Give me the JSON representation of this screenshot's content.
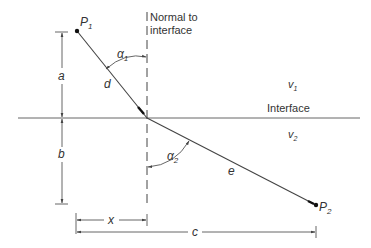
{
  "diagram": {
    "colors": {
      "background": "#ffffff",
      "line": "#555555",
      "ray": "#444444",
      "text": "#333333",
      "point": "#111111"
    },
    "points": {
      "p1": {
        "label": "P",
        "sub": "1"
      },
      "p2": {
        "label": "P",
        "sub": "2"
      }
    },
    "normal_label": {
      "line1": "Normal to",
      "line2": "interface"
    },
    "interface_label": "Interface",
    "media": {
      "upper": {
        "label": "v",
        "sub": "1"
      },
      "lower": {
        "label": "v",
        "sub": "2"
      }
    },
    "angles": {
      "incident": {
        "label": "α",
        "sub": "1"
      },
      "refracted": {
        "label": "α",
        "sub": "2"
      }
    },
    "segments": {
      "incident": "d",
      "refracted": "e"
    },
    "dimensions": {
      "a": "a",
      "b": "b",
      "x": "x",
      "c": "c"
    }
  }
}
